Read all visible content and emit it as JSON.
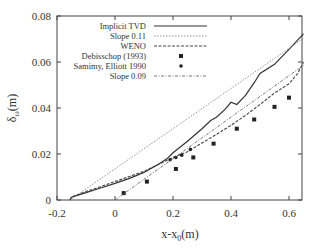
{
  "chart_data": {
    "type": "line",
    "title": "",
    "xlabel": "x-x",
    "xlabel_sub": "0",
    "xlabel_unit": "(m)",
    "ylabel": "δ",
    "ylabel_sub": "ω",
    "ylabel_unit": "(m)",
    "xlim": [
      -0.2,
      0.65
    ],
    "ylim": [
      0,
      0.08
    ],
    "xticks": [
      -0.2,
      0,
      0.2,
      0.4,
      0.6
    ],
    "xtick_labels": [
      "-0.2",
      "0",
      "0.2",
      "0.4",
      "0.6"
    ],
    "yticks": [
      0,
      0.02,
      0.04,
      0.06,
      0.08
    ],
    "ytick_labels": [
      "0",
      "0.02",
      "0.04",
      "0.06",
      "0.08"
    ],
    "grid": false,
    "legend_position": "upper-left",
    "series": [
      {
        "name": "Implicit TVD",
        "style": "solid",
        "x": [
          -0.155,
          -0.15,
          -0.13,
          -0.1,
          -0.05,
          0.0,
          0.05,
          0.1,
          0.15,
          0.18,
          0.2,
          0.25,
          0.3,
          0.33,
          0.35,
          0.38,
          0.4,
          0.42,
          0.45,
          0.48,
          0.5,
          0.55,
          0.6,
          0.65
        ],
        "y": [
          0.0,
          0.0012,
          0.002,
          0.0032,
          0.0052,
          0.0072,
          0.0094,
          0.012,
          0.0155,
          0.018,
          0.0205,
          0.0255,
          0.031,
          0.0345,
          0.036,
          0.0395,
          0.0425,
          0.0415,
          0.0455,
          0.051,
          0.055,
          0.059,
          0.0655,
          0.0722
        ]
      },
      {
        "name": "Slope 0.11",
        "style": "dotted",
        "x": [
          -0.155,
          0.65
        ],
        "y": [
          0.0,
          0.0703
        ]
      },
      {
        "name": "WENO",
        "style": "dashed",
        "x": [
          -0.155,
          -0.15,
          -0.1,
          -0.05,
          0.0,
          0.05,
          0.1,
          0.15,
          0.2,
          0.25,
          0.3,
          0.35,
          0.4,
          0.45,
          0.5,
          0.55,
          0.6,
          0.63,
          0.65
        ],
        "y": [
          0.0,
          0.0013,
          0.0037,
          0.0058,
          0.008,
          0.0102,
          0.0125,
          0.0155,
          0.0185,
          0.021,
          0.0248,
          0.0285,
          0.0325,
          0.0368,
          0.0415,
          0.0465,
          0.0505,
          0.055,
          0.06
        ]
      },
      {
        "name": "Debisschop (1993)",
        "style": "square-marker",
        "x": [
          0.03,
          0.11,
          0.21,
          0.27,
          0.34,
          0.42,
          0.48,
          0.55,
          0.6
        ],
        "y": [
          0.003,
          0.008,
          0.0135,
          0.0185,
          0.0245,
          0.031,
          0.035,
          0.0405,
          0.0445
        ]
      },
      {
        "name": "Samimy, Elliott 1990",
        "style": "circle-marker",
        "x": [
          0.19,
          0.21,
          0.23,
          0.26
        ],
        "y": [
          0.0175,
          0.0185,
          0.0195,
          0.022
        ]
      },
      {
        "name": "Slope 0.09",
        "style": "dash-dot",
        "x": [
          0.0,
          0.65
        ],
        "y": [
          0.0,
          0.0585
        ]
      }
    ]
  },
  "legend": {
    "items": [
      {
        "label": "Implicit TVD"
      },
      {
        "label": "Slope 0.11"
      },
      {
        "label": "WENO"
      },
      {
        "label": "Debisschop (1993)"
      },
      {
        "label": "Samimy, Elliott 1990"
      },
      {
        "label": "Slope 0.09"
      }
    ]
  },
  "colors": {
    "axis": "#444444",
    "line": "#333333",
    "dotted": "#888888",
    "background": "#ffffff"
  }
}
